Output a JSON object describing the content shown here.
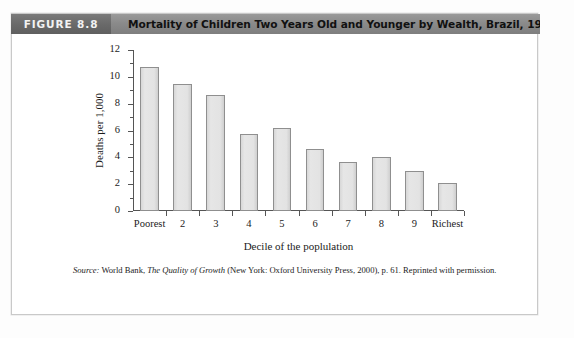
{
  "figure": {
    "tag": "FIGURE 8.8",
    "title": "Mortality of Children Two Years Old and Younger by Wealth, Brazil, 1996",
    "tag_bg": "#6d6d6d",
    "header_bg": "#8c8c8c"
  },
  "source": {
    "label": "Source:",
    "text_before_title": " World Bank, ",
    "work_title": "The Quality of Growth",
    "text_after_title": " (New York: Oxford University Press, 2000), p. 61. Reprinted with permission."
  },
  "chart_data": {
    "type": "bar",
    "title": "Mortality of Children Two Years Old and Younger by Wealth, Brazil, 1996",
    "subtitle": "",
    "xlabel": "Decile of the poplulation",
    "ylabel": "Deaths per 1,000",
    "categories": [
      "Poorest",
      "2",
      "3",
      "4",
      "5",
      "6",
      "7",
      "8",
      "9",
      "Richest"
    ],
    "values": [
      10.7,
      9.45,
      8.65,
      5.75,
      6.15,
      4.65,
      3.65,
      4.05,
      2.95,
      2.1
    ],
    "ylim": [
      0,
      12
    ],
    "yticks": [
      0,
      2,
      4,
      6,
      8,
      10,
      12
    ],
    "ytick_labels": [
      "0",
      "2",
      "4",
      "6",
      "8",
      "10",
      "12"
    ],
    "yminor_ticks": [
      1,
      3,
      5,
      7,
      9,
      11
    ],
    "grid": false,
    "legend": "none",
    "bar_fill": "#e2e2e2",
    "bar_edge": "#8f8f8f"
  }
}
